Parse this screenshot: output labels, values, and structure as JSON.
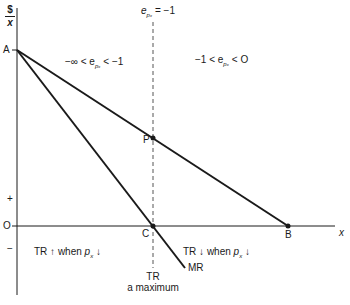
{
  "diagram": {
    "y_axis_label": {
      "numerator": "$",
      "denominator": "x"
    },
    "x_axis_label": "x",
    "origin_label": "O",
    "sign_plus": "+",
    "sign_minus": "−",
    "points": {
      "A": "A",
      "P": "P",
      "C": "C",
      "B": "B"
    },
    "curves": {
      "demand": "AB",
      "marginal_revenue": "MR"
    },
    "unit_elastic_line": {
      "prefix": "e",
      "subscript": "pₓ",
      "suffix": " = −1"
    },
    "regions": {
      "elastic": {
        "prefix": "−∞ < e",
        "subscript": "pₓ",
        "suffix": " < −1"
      },
      "inelastic": {
        "prefix": "−1 < e",
        "subscript": "pₓ",
        "suffix": " < O"
      }
    },
    "notes": {
      "left": {
        "prefix": "TR ↑ when ",
        "var": "p",
        "subscript": "x",
        "suffix": " ↓"
      },
      "right": {
        "prefix": "TR ↓ when ",
        "var": "p",
        "subscript": "x",
        "suffix": " ↓"
      }
    },
    "tr_max": {
      "line1": "TR",
      "line2": "a maximum"
    },
    "colors": {
      "ink": "#1a1a1a",
      "dashed": "#555555",
      "background": "#ffffff"
    }
  }
}
